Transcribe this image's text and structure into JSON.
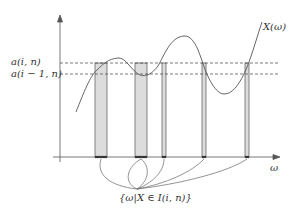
{
  "diagram": {
    "curve_label": "X(ω)",
    "x_axis_label": "ω",
    "level_labels": [
      {
        "label": "a(i, n)",
        "y": 63
      },
      {
        "label": "a(i − 1, n)",
        "y": 74
      }
    ],
    "set_label": "{ω|X ∈ I(i, n)}",
    "colors": {
      "stroke": "#555555",
      "bar_fill": "#dcdcdc",
      "bar_stroke": "#666666",
      "dash": "#444444",
      "bar_base": "#222222"
    },
    "bars": [
      {
        "x1": 95,
        "x2": 107
      },
      {
        "x1": 135,
        "x2": 147
      },
      {
        "x1": 162,
        "x2": 166
      },
      {
        "x1": 202,
        "x2": 206
      },
      {
        "x1": 245,
        "x2": 249
      }
    ],
    "axes": {
      "origin_x": 60,
      "origin_y": 157,
      "y_top": 17,
      "x_right": 278
    },
    "convergence_point": {
      "x": 137,
      "y": 189
    }
  }
}
